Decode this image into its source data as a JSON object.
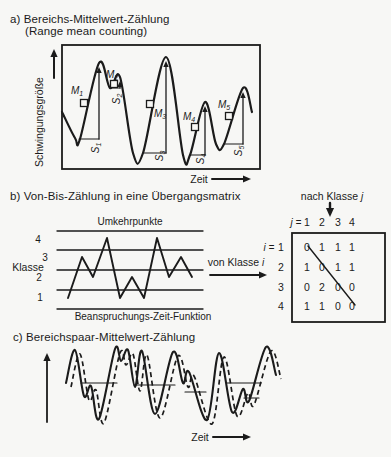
{
  "colors": {
    "bg": "#f7f7f5",
    "ink": "#1b1b1b"
  },
  "panel_a": {
    "title": "a) Bereichs-Mittelwert-Zählung",
    "subtitle": "(Range mean counting)",
    "y_axis_label": "Schwingungsgröße",
    "x_axis_label": "Zeit",
    "box": {
      "x": 62,
      "y": 45,
      "w": 198,
      "h": 124
    },
    "y_arrow": {
      "x": 54,
      "y1": 78,
      "y2": 49
    },
    "x_arrow": {
      "x1": 212,
      "x2": 251,
      "y": 179
    },
    "wave_points": [
      [
        62,
        112
      ],
      [
        75,
        138
      ],
      [
        80,
        139
      ],
      [
        99,
        63
      ],
      [
        110,
        88
      ],
      [
        120,
        77
      ],
      [
        133,
        153
      ],
      [
        143,
        153
      ],
      [
        166,
        57
      ],
      [
        183,
        155
      ],
      [
        190,
        155
      ],
      [
        205,
        102
      ],
      [
        216,
        144
      ],
      [
        224,
        144
      ],
      [
        243,
        88
      ],
      [
        252,
        112
      ]
    ],
    "range_lines": [
      {
        "name": "S",
        "sub": "1",
        "x": 99,
        "y_top": 67,
        "y_bottom": 139,
        "base_x": 79,
        "label": {
          "x": 94,
          "y": 148
        }
      },
      {
        "name": "S",
        "sub": "2",
        "x": 120,
        "y_top": 81,
        "y_bottom": 88,
        "base_x": 110,
        "label": {
          "x": 115,
          "y": 99
        }
      },
      {
        "name": "S",
        "sub": "3",
        "x": 166,
        "y_top": 61,
        "y_bottom": 153,
        "base_x": 144,
        "label": {
          "x": 158,
          "y": 156
        }
      },
      {
        "name": "S",
        "sub": "4",
        "x": 205,
        "y_top": 106,
        "y_bottom": 155,
        "base_x": 191,
        "label": {
          "x": 199,
          "y": 159
        }
      },
      {
        "name": "S",
        "sub": "5",
        "x": 243,
        "y_top": 92,
        "y_bottom": 144,
        "base_x": 225,
        "label": {
          "x": 237,
          "y": 151
        }
      }
    ],
    "mean_markers": [
      {
        "name": "M",
        "sub": "1",
        "x": 84,
        "y": 103,
        "label": {
          "x": 77,
          "y": 89
        }
      },
      {
        "name": "M",
        "sub": "2",
        "x": 114,
        "y": 84,
        "label": {
          "x": 112,
          "y": 73
        }
      },
      {
        "name": "M",
        "sub": "3",
        "x": 150,
        "y": 104,
        "label": {
          "x": 160,
          "y": 112
        }
      },
      {
        "name": "M",
        "sub": "4",
        "x": 195,
        "y": 127,
        "label": {
          "x": 189,
          "y": 115
        }
      },
      {
        "name": "M",
        "sub": "5",
        "x": 229,
        "y": 116,
        "label": {
          "x": 224,
          "y": 103
        }
      }
    ]
  },
  "panel_b": {
    "title": "b) Von-Bis-Zählung in eine Übergangsmatrix",
    "plot": {
      "top_label": "Umkehrpunkte",
      "bottom_label": "Beanspruchungs-Zeit-Funktion",
      "y_axis_label": "Klasse",
      "gridline_ys": [
        231,
        250,
        270,
        290,
        309
      ],
      "grid_x1": 57,
      "grid_x2": 203,
      "class_labels": [
        {
          "text": "4",
          "x": 38,
          "y": 239
        },
        {
          "text": "3",
          "x": 45,
          "y": 257
        },
        {
          "text": "2",
          "x": 39,
          "y": 277
        },
        {
          "text": "1",
          "x": 40,
          "y": 297
        }
      ],
      "zigzag_x": [
        68,
        82,
        93,
        107,
        120,
        132,
        144,
        157,
        169,
        181,
        192
      ],
      "zigzag_classes": [
        1,
        3,
        2,
        4,
        1,
        2,
        1,
        4,
        2,
        3,
        2
      ],
      "class_y": {
        "1": 298,
        "2": 277,
        "3": 257,
        "4": 238
      }
    },
    "link_label": {
      "text": "von Klasse",
      "var": "i"
    },
    "link_arrow": {
      "x1": 210,
      "x2": 267,
      "y": 275
    },
    "matrix": {
      "top_label": {
        "text": "nach Klasse",
        "var": "j"
      },
      "down_arrow": {
        "x": 330,
        "y1": 203,
        "y2": 217
      },
      "col_prefix": "j =",
      "row_prefix": "i =",
      "col_labels": [
        "1",
        "2",
        "3",
        "4"
      ],
      "row_labels": [
        "1",
        "2",
        "3",
        "4"
      ],
      "col_xs": [
        307,
        322,
        338,
        352
      ],
      "row_ys": [
        247,
        267,
        287,
        306
      ],
      "header_y": 222,
      "row_label_x": 281,
      "box": {
        "x": 292,
        "y": 233,
        "w": 93,
        "h": 89
      },
      "values": [
        [
          0,
          1,
          1,
          1
        ],
        [
          1,
          0,
          1,
          1
        ],
        [
          0,
          2,
          0,
          0
        ],
        [
          1,
          1,
          0,
          0
        ]
      ],
      "diagonal": {
        "x1": 308,
        "y1": 246,
        "x2": 355,
        "y2": 305
      }
    }
  },
  "panel_c": {
    "title": "c) Bereichspaar-Mittelwert-Zählung",
    "x_axis_label": "Zeit",
    "y_arrow": {
      "x": 47,
      "y1": 422,
      "y2": 353
    },
    "x_arrow": {
      "x1": 213,
      "x2": 251,
      "y": 437
    },
    "solid_points": [
      [
        66,
        383
      ],
      [
        75,
        350
      ],
      [
        84,
        396
      ],
      [
        91,
        386
      ],
      [
        99,
        419
      ],
      [
        115,
        349
      ],
      [
        121,
        361
      ],
      [
        128,
        350
      ],
      [
        135,
        387
      ],
      [
        142,
        351
      ],
      [
        155,
        414
      ],
      [
        173,
        352
      ],
      [
        183,
        383
      ],
      [
        189,
        372
      ],
      [
        207,
        420
      ],
      [
        219,
        353
      ],
      [
        232,
        412
      ],
      [
        243,
        389
      ],
      [
        249,
        401
      ],
      [
        266,
        347
      ],
      [
        276,
        375
      ]
    ],
    "dash_offset": [
      5,
      4
    ],
    "h_segments": [
      [
        81,
        383,
        117
      ],
      [
        134,
        385,
        175
      ],
      [
        185,
        392,
        206
      ],
      [
        227,
        383,
        261
      ],
      [
        244,
        398,
        259
      ]
    ]
  }
}
